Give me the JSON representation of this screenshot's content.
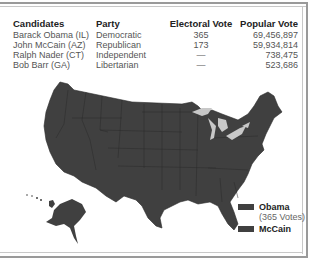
{
  "table": {
    "headers": [
      "Candidates",
      "Party",
      "Electoral Vote",
      "Popular Vote"
    ],
    "rows": [
      {
        "candidate": "Barack Obama (IL)",
        "party": "Democratic",
        "electoral": "365",
        "popular": "69,456,897"
      },
      {
        "candidate": "John McCain (AZ)",
        "party": "Republican",
        "electoral": "173",
        "popular": "59,934,814"
      },
      {
        "candidate": "Ralph Nader (CT)",
        "party": "Independent",
        "electoral": "—",
        "popular": "738,475"
      },
      {
        "candidate": "Bob Barr (GA)",
        "party": "Libertarian",
        "electoral": "—",
        "popular": "523,686"
      }
    ]
  },
  "map": {
    "title": "United States electoral map",
    "land_color": "#404040",
    "lakes_color": "#c8c8c8",
    "border_color": "#2a2a2a"
  },
  "legend": {
    "items": [
      {
        "label": "Obama",
        "sub": "(365 Votes)",
        "color": "#404040"
      },
      {
        "label": "McCain",
        "color": "#404040"
      }
    ]
  }
}
